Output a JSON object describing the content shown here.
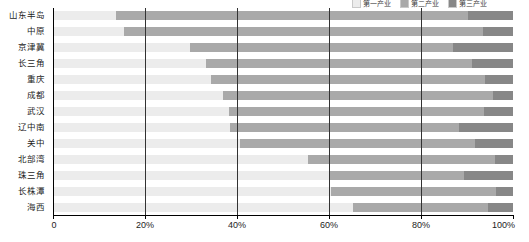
{
  "chart_data": {
    "type": "bar",
    "orientation": "horizontal",
    "stacked": true,
    "stack_mode": "percent",
    "title": "",
    "xlabel": "",
    "ylabel": "",
    "xlim": [
      0,
      100
    ],
    "xticks": [
      0,
      20,
      40,
      60,
      80,
      100
    ],
    "xticklabels": [
      "0",
      "20%",
      "40%",
      "60%",
      "80%",
      "100%"
    ],
    "grid": true,
    "grid_axis": "x",
    "legend_position": "top-right",
    "categories": [
      "山东半岛",
      "中原",
      "京津冀",
      "长三角",
      "重庆",
      "成都",
      "武汉",
      "辽中南",
      "关中",
      "北部湾",
      "珠三角",
      "长株潭",
      "海西"
    ],
    "series": [
      {
        "name": "第一产业",
        "color": "#ececec",
        "values": [
          13.6,
          15.4,
          29.8,
          33.2,
          34.4,
          37.0,
          38.2,
          38.5,
          40.7,
          55.4,
          60.2,
          60.5,
          65.2
        ]
      },
      {
        "name": "第二产业",
        "color": "#a9a9a9",
        "values": [
          76.6,
          78.0,
          57.2,
          57.9,
          59.5,
          58.7,
          55.4,
          49.8,
          51.0,
          40.6,
          29.1,
          35.9,
          29.4
        ]
      },
      {
        "name": "第三产业",
        "color": "#878787",
        "values": [
          9.8,
          6.6,
          13.0,
          8.9,
          6.1,
          4.3,
          6.4,
          11.7,
          8.3,
          4.0,
          10.7,
          3.6,
          5.4
        ]
      }
    ]
  },
  "legend": {
    "items": [
      {
        "label": "第一产业",
        "color": "#ececec"
      },
      {
        "label": "第二产业",
        "color": "#a9a9a9"
      },
      {
        "label": "第三产业",
        "color": "#878787"
      }
    ]
  },
  "axis": {
    "x_tick_labels": [
      "0",
      "20%",
      "40%",
      "60%",
      "80%",
      "100%"
    ],
    "y_tick_labels": [
      "山东半岛",
      "中原",
      "京津冀",
      "长三角",
      "重庆",
      "成都",
      "武汉",
      "辽中南",
      "关中",
      "北部湾",
      "珠三角",
      "长株潭",
      "海西"
    ]
  }
}
